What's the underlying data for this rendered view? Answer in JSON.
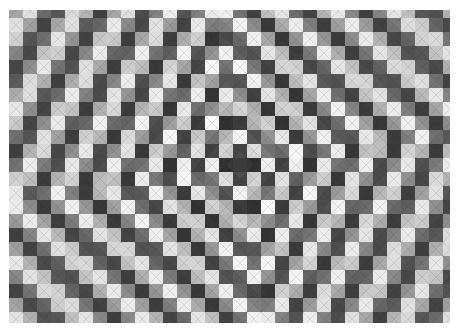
{
  "figure": {
    "title": "",
    "kind": "triangular-mesh-field-plot",
    "background_color": "#ffffff",
    "width": 459,
    "height": 336
  },
  "plot_area": {
    "x": 9,
    "y": 10,
    "width": 441,
    "height": 313,
    "border": "none"
  },
  "chart_data": {
    "type": "heatmap",
    "title": "",
    "subtitle": "",
    "xlabel": "",
    "ylabel": "",
    "legend": "none",
    "grid": false,
    "colormap": "gray",
    "colormap_low_hex": "#2b2b2b",
    "colormap_high_hex": "#ffffff",
    "mesh": {
      "element_shape": "square-split-into-4-triangles",
      "cell_size_px": 14,
      "cols": 32,
      "rows": 23,
      "diagonals_visible": true,
      "diagonal_contrast": 0.07
    },
    "field": {
      "description": "concentric diamond (Manhattan-distance) chirped cosine rings about a dark center point",
      "metric": "manhattan",
      "center_px": [
        240,
        165
      ],
      "center_cell_value": 0.08,
      "amplitude_center": 1.0,
      "amplitude_edge": 0.62,
      "base_wavelength_px": 44,
      "chirp": 0.42,
      "phase": 3.14159,
      "aspect_x": 1.0,
      "aspect_y": 1.18,
      "rotation_deg": -9,
      "value_min": 0.0,
      "value_max": 1.0,
      "ring_count_visible": 5
    },
    "rings": [
      {
        "index": 0,
        "label": "center",
        "manhattan_radius_px": 0,
        "value": 0.08,
        "tone": "dark"
      },
      {
        "index": 1,
        "label": "ring-1",
        "manhattan_radius_px": 22,
        "value": 0.97,
        "tone": "light"
      },
      {
        "index": 2,
        "label": "ring-2",
        "manhattan_radius_px": 48,
        "value": 0.12,
        "tone": "dark"
      },
      {
        "index": 3,
        "label": "ring-3",
        "manhattan_radius_px": 82,
        "value": 0.95,
        "tone": "light"
      },
      {
        "index": 4,
        "label": "ring-4",
        "manhattan_radius_px": 124,
        "value": 0.15,
        "tone": "dark"
      },
      {
        "index": 5,
        "label": "ring-5",
        "manhattan_radius_px": 176,
        "value": 0.9,
        "tone": "light"
      },
      {
        "index": 6,
        "label": "ring-6",
        "manhattan_radius_px": 238,
        "value": 0.2,
        "tone": "dark"
      }
    ],
    "axes": {
      "x_visible": false,
      "y_visible": false,
      "xticks": [],
      "yticks": [],
      "xticklabels": [],
      "yticklabels": []
    },
    "annotations": []
  }
}
